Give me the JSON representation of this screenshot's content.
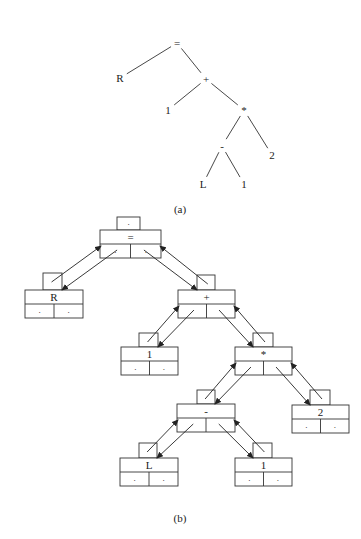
{
  "figure_a": {
    "caption": "(a)",
    "nodes": [
      {
        "id": "eq",
        "label": "=",
        "x": 177,
        "y": 43
      },
      {
        "id": "R",
        "label": "R",
        "x": 120,
        "y": 78
      },
      {
        "id": "plus",
        "label": "+",
        "x": 206,
        "y": 79
      },
      {
        "id": "one1",
        "label": "1",
        "x": 168,
        "y": 110
      },
      {
        "id": "star",
        "label": "*",
        "x": 244,
        "y": 110
      },
      {
        "id": "minus",
        "label": "-",
        "x": 222,
        "y": 146
      },
      {
        "id": "two",
        "label": "2",
        "x": 272,
        "y": 155
      },
      {
        "id": "L",
        "label": "L",
        "x": 203,
        "y": 184
      },
      {
        "id": "one2",
        "label": "1",
        "x": 244,
        "y": 184
      }
    ],
    "edges": [
      [
        "eq",
        "R"
      ],
      [
        "eq",
        "plus"
      ],
      [
        "plus",
        "one1"
      ],
      [
        "plus",
        "star"
      ],
      [
        "star",
        "minus"
      ],
      [
        "star",
        "two"
      ],
      [
        "minus",
        "L"
      ],
      [
        "minus",
        "one2"
      ]
    ]
  },
  "figure_b": {
    "caption": "(b)",
    "nodes": [
      {
        "id": "eq",
        "label": "=",
        "dot": ".",
        "left": ".",
        "right": ".",
        "bx": 100,
        "by": 230,
        "bw": 61,
        "tx": 117,
        "ty": 217,
        "tw": 23
      },
      {
        "id": "R",
        "label": "R",
        "dot": "",
        "left": ".",
        "right": ".",
        "bx": 25,
        "by": 290,
        "bw": 58,
        "tx": 43,
        "ty": 273,
        "tw": 19
      },
      {
        "id": "plus",
        "label": "+",
        "dot": "",
        "left": "",
        "right": "",
        "bx": 178,
        "by": 290,
        "bw": 57,
        "tx": 197,
        "ty": 275,
        "tw": 18
      },
      {
        "id": "one1",
        "label": "1",
        "dot": "",
        "left": ".",
        "right": ".",
        "bx": 121,
        "by": 347,
        "bw": 57,
        "tx": 139,
        "ty": 333,
        "tw": 19
      },
      {
        "id": "star",
        "label": "*",
        "dot": "",
        "left": "",
        "right": "",
        "bx": 235,
        "by": 347,
        "bw": 57,
        "tx": 253,
        "ty": 333,
        "tw": 20
      },
      {
        "id": "minus",
        "label": "-",
        "dot": "",
        "left": "",
        "right": "",
        "bx": 177,
        "by": 404,
        "bw": 58,
        "tx": 197,
        "ty": 390,
        "tw": 18
      },
      {
        "id": "two",
        "label": "2",
        "dot": "",
        "left": ".",
        "right": ".",
        "bx": 292,
        "by": 405,
        "bw": 57,
        "tx": 310,
        "ty": 390,
        "tw": 20
      },
      {
        "id": "L",
        "label": "L",
        "dot": "",
        "left": ".",
        "right": ".",
        "bx": 120,
        "by": 458,
        "bw": 58,
        "tx": 139,
        "ty": 443,
        "tw": 18
      },
      {
        "id": "one2",
        "label": "1",
        "dot": "",
        "left": ".",
        "right": ".",
        "bx": 235,
        "by": 458,
        "bw": 57,
        "tx": 253,
        "ty": 443,
        "tw": 19
      }
    ],
    "links": [
      [
        "eq",
        "R",
        "left"
      ],
      [
        "eq",
        "plus",
        "right"
      ],
      [
        "plus",
        "one1",
        "left"
      ],
      [
        "plus",
        "star",
        "right"
      ],
      [
        "star",
        "minus",
        "left"
      ],
      [
        "star",
        "two",
        "right"
      ],
      [
        "minus",
        "L",
        "left"
      ],
      [
        "minus",
        "one2",
        "right"
      ]
    ]
  }
}
